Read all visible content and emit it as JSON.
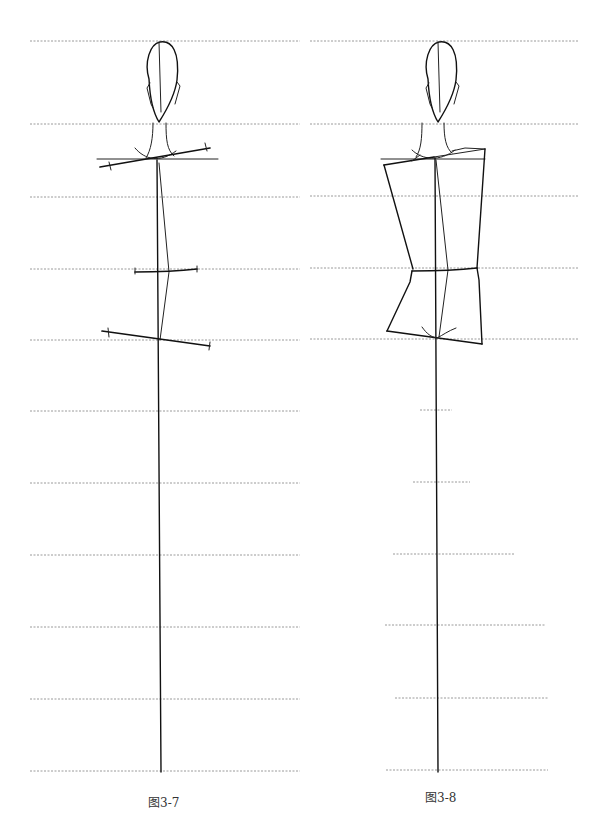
{
  "figures": [
    {
      "id": "fig-3-7",
      "caption": "图3-7",
      "description": "Fashion croquis construction: head, neck, center balance line with shoulder, waist and hip slant lines",
      "guide_lines_y": [
        41,
        124,
        196,
        268,
        340,
        411,
        483,
        555,
        627,
        699,
        771
      ]
    },
    {
      "id": "fig-3-8",
      "caption": "图3-8",
      "description": "Fashion croquis construction: head, neck, torso block drawn between shoulder, waist and hip lines",
      "guide_lines_y": [
        41,
        124,
        196,
        268,
        340,
        410,
        483,
        555,
        627,
        699,
        771
      ]
    }
  ]
}
